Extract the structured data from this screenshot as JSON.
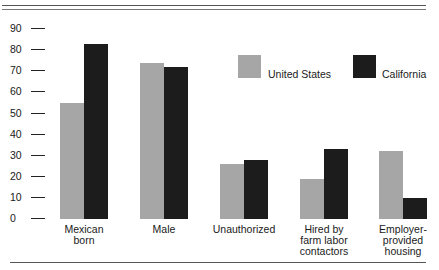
{
  "chart_data": {
    "type": "bar",
    "title": "",
    "xlabel": "",
    "ylabel": "",
    "ylim": [
      0,
      90
    ],
    "yticks": [
      0,
      10,
      20,
      30,
      40,
      50,
      60,
      70,
      80,
      90
    ],
    "ytick_labels": [
      "0—",
      "10—",
      "20—",
      "30—",
      "40—",
      "50—",
      "60—",
      "70—",
      "80—",
      "90—"
    ],
    "categories": [
      "Mexican born",
      "Male",
      "Unauthorized",
      "Hired by farm labor contactors",
      "Employer-provided housing"
    ],
    "category_labels": [
      "Mexican\nborn",
      "Male",
      "Unauthorized",
      "Hired by\nfarm labor\ncontactors",
      "Employer-\nprovided\nhousing"
    ],
    "series": [
      {
        "name": "United States",
        "color": "#a6a6a6",
        "values": [
          55,
          74,
          26,
          19,
          32
        ]
      },
      {
        "name": "California",
        "color": "#1c1c1c",
        "values": [
          83,
          72,
          28,
          33,
          10
        ]
      }
    ],
    "legend": {
      "position": "upper right, inside plot"
    },
    "grid": false
  }
}
